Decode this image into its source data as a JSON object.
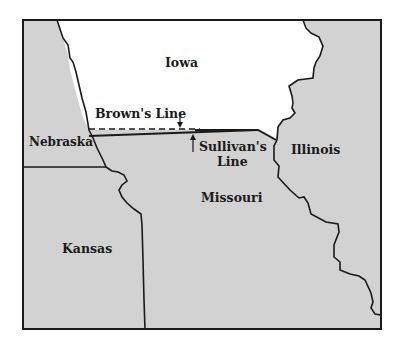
{
  "map": {
    "title": "Iowa–Missouri boundary dispute map",
    "colors": {
      "background": "#ffffff",
      "state_fill": "#d2d2d2",
      "iowa_fill": "#ffffff",
      "border": "#1a1a1a"
    },
    "states": [
      {
        "id": "iowa",
        "label": "Iowa"
      },
      {
        "id": "nebraska",
        "label": "Nebraska"
      },
      {
        "id": "illinois",
        "label": "Illinois"
      },
      {
        "id": "missouri",
        "label": "Missouri"
      },
      {
        "id": "kansas",
        "label": "Kansas"
      }
    ],
    "annotations": {
      "browns_line": "Brown's Line",
      "sullivans_line_1": "Sullivan's",
      "sullivans_line_2": "Line"
    }
  }
}
